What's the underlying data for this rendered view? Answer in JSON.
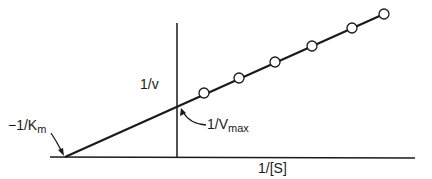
{
  "diagram": {
    "type": "Lineweaver-Burk plot",
    "y_axis_label": "1/v",
    "x_axis_label": "1/[S]",
    "x_intercept_label": {
      "prefix": "−1/K",
      "sub": "m"
    },
    "y_intercept_label": {
      "prefix": "1/V",
      "sub": "max"
    },
    "line_color": "#1a1a1a",
    "points": [
      {
        "x": 204,
        "y": 93
      },
      {
        "x": 239,
        "y": 78
      },
      {
        "x": 275,
        "y": 62
      },
      {
        "x": 312,
        "y": 46
      },
      {
        "x": 352,
        "y": 28
      },
      {
        "x": 384,
        "y": 14
      }
    ]
  }
}
